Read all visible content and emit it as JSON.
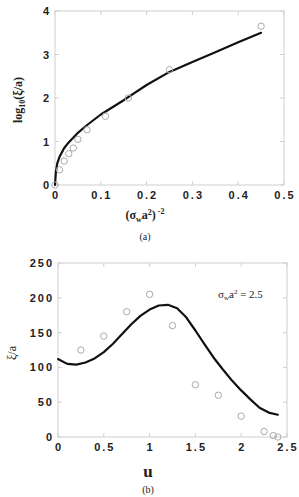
{
  "chart_data": [
    {
      "id": "a",
      "type": "line",
      "caption": "(a)",
      "title": "",
      "xlabel": "(σwa²)⁻²",
      "ylabel": "log10(ξ/a)",
      "xlim": [
        0,
        0.5
      ],
      "ylim": [
        0,
        4
      ],
      "xticks": [
        "0",
        "0.1",
        "0.2",
        "0.3",
        "0.4",
        "0.5"
      ],
      "yticks": [
        "0",
        "1",
        "2",
        "3",
        "4"
      ],
      "grid": false,
      "series": [
        {
          "name": "theory",
          "style": "solid-line",
          "x": [
            0,
            0.002,
            0.005,
            0.01,
            0.02,
            0.03,
            0.05,
            0.07,
            0.1,
            0.15,
            0.2,
            0.25,
            0.3,
            0.35,
            0.4,
            0.45
          ],
          "y": [
            0,
            0.3,
            0.5,
            0.65,
            0.85,
            0.98,
            1.2,
            1.38,
            1.62,
            1.95,
            2.3,
            2.6,
            2.83,
            3.05,
            3.28,
            3.5
          ]
        },
        {
          "name": "simulation",
          "style": "open-circles",
          "x": [
            0,
            0.01,
            0.02,
            0.03,
            0.04,
            0.05,
            0.07,
            0.11,
            0.16,
            0.25,
            0.45
          ],
          "y": [
            0,
            0.35,
            0.55,
            0.72,
            0.85,
            1.05,
            1.27,
            1.58,
            2.0,
            2.65,
            3.65
          ]
        }
      ]
    },
    {
      "id": "b",
      "type": "line",
      "caption": "(b)",
      "title": "",
      "annotation": "σwa² = 2.5",
      "xlabel": "u",
      "ylabel": "ξ/a",
      "xlim": [
        0,
        2.5
      ],
      "ylim": [
        0,
        250
      ],
      "xticks": [
        "0",
        "0.5",
        "1",
        "1.5",
        "2",
        "2.5"
      ],
      "yticks": [
        "0",
        "50",
        "100",
        "150",
        "200",
        "250"
      ],
      "grid": false,
      "series": [
        {
          "name": "theory",
          "style": "solid-line",
          "x": [
            0,
            0.1,
            0.2,
            0.3,
            0.4,
            0.5,
            0.6,
            0.7,
            0.8,
            0.9,
            1.0,
            1.1,
            1.2,
            1.3,
            1.4,
            1.5,
            1.6,
            1.7,
            1.8,
            1.9,
            2.0,
            2.1,
            2.2,
            2.3,
            2.4
          ],
          "y": [
            112,
            105,
            104,
            107,
            113,
            122,
            134,
            148,
            162,
            174,
            183,
            189,
            190,
            185,
            172,
            153,
            133,
            114,
            97,
            81,
            67,
            54,
            42,
            35,
            32
          ]
        },
        {
          "name": "simulation",
          "style": "open-circles",
          "x": [
            0.25,
            0.5,
            0.75,
            1.0,
            1.25,
            1.5,
            1.75,
            2.0,
            2.25,
            2.35,
            2.4
          ],
          "y": [
            125,
            145,
            180,
            205,
            160,
            75,
            60,
            30,
            8,
            2,
            0
          ]
        }
      ]
    }
  ],
  "figure": {
    "a": {
      "caption": "(a)",
      "xlabel_base": "(σ",
      "xlabel_sub": "w",
      "xlabel_mid": "a",
      "xlabel_sup2": "2",
      "xlabel_end": ")",
      "xlabel_exp": "-2",
      "ylabel_pre": "log",
      "ylabel_sub": "10",
      "ylabel_post": "(ξ/a)"
    },
    "b": {
      "caption": "(b)",
      "xlabel": "u",
      "ylabel": "ξ/a",
      "annotation_sigma": "σ",
      "annotation_sub": "w",
      "annotation_a": "a",
      "annotation_sup": "2",
      "annotation_rest": " = 2.5"
    }
  },
  "colors": {
    "line": "#111111",
    "marker": "#aaaaaa",
    "frame": "#cfcfcf"
  }
}
